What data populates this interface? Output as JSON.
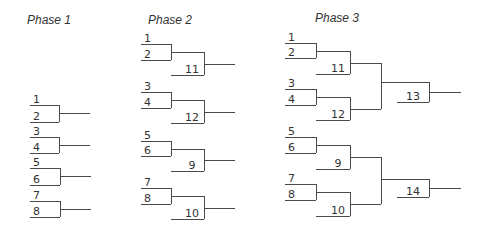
{
  "phases": [
    {
      "title": "Phase 1",
      "title_pos": [
        27,
        24
      ],
      "matches": [
        {
          "top": "1",
          "bottom": "2",
          "x1": 30,
          "x2": 59,
          "yt": 105,
          "yb": 122,
          "stub": 90
        },
        {
          "top": "3",
          "bottom": "4",
          "x1": 30,
          "x2": 59,
          "yt": 137,
          "yb": 153,
          "stub": 90
        },
        {
          "top": "5",
          "bottom": "6",
          "x1": 30,
          "x2": 60,
          "yt": 168,
          "yb": 185,
          "stub": 91
        },
        {
          "top": "7",
          "bottom": "8",
          "x1": 30,
          "x2": 60,
          "yt": 201,
          "yb": 217,
          "stub": 91
        }
      ]
    },
    {
      "title": "Phase 2",
      "title_pos": [
        148,
        24
      ],
      "groups": [
        {
          "top": "1",
          "bottom": "2",
          "bye": "11",
          "yt": 44,
          "yb": 60,
          "ybye": 75
        },
        {
          "top": "3",
          "bottom": "4",
          "bye": "12",
          "yt": 92,
          "yb": 108,
          "ybye": 123
        },
        {
          "top": "5",
          "bottom": "6",
          "bye": "9",
          "yt": 141,
          "yb": 156,
          "ybye": 171
        },
        {
          "top": "7",
          "bottom": "8",
          "bye": "10",
          "yt": 188,
          "yb": 204,
          "ybye": 219
        }
      ],
      "x": {
        "left": 141,
        "v1": 171,
        "v2": 204,
        "stub": 235
      }
    },
    {
      "title": "Phase 3",
      "title_pos": [
        315,
        22
      ],
      "groups": [
        {
          "top": "1",
          "bottom": "2",
          "bye": "11",
          "yt": 43,
          "yb": 58,
          "ybye": 74
        },
        {
          "top": "3",
          "bottom": "4",
          "bye": "12",
          "yt": 89,
          "yb": 105,
          "ybye": 120
        },
        {
          "top": "5",
          "bottom": "6",
          "bye": "9",
          "yt": 137,
          "yb": 153,
          "ybye": 169
        },
        {
          "top": "7",
          "bottom": "8",
          "bye": "10",
          "yt": 184,
          "yb": 200,
          "ybye": 216
        }
      ],
      "finals": [
        {
          "label": "13",
          "ymid": 82,
          "ylabel": 102
        },
        {
          "label": "14",
          "ymid": 179,
          "ylabel": 197
        }
      ],
      "x": {
        "left": 285,
        "v1": 316,
        "v2": 350,
        "v3": 381,
        "v4": 429,
        "stub": 461,
        "final_left": 397
      }
    }
  ]
}
